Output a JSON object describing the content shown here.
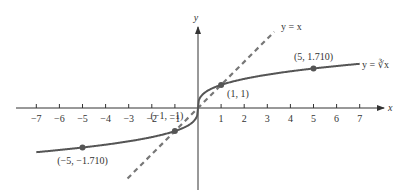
{
  "chart_data": {
    "type": "line",
    "title": "",
    "xlabel": "x",
    "ylabel": "y",
    "xlim": [
      -7.8,
      8
    ],
    "ylim": [
      -3.5,
      3.5
    ],
    "grid": false,
    "x_ticks": [
      -7,
      -6,
      -5,
      -4,
      -3,
      -2,
      -1,
      1,
      2,
      3,
      4,
      5,
      6,
      7
    ],
    "x_tick_labels": [
      "−7",
      "−6",
      "−5",
      "−4",
      "−3",
      "−2",
      "−1",
      "1",
      "2",
      "3",
      "4",
      "5",
      "6",
      "7"
    ],
    "series": [
      {
        "name": "y = ∛x",
        "style": "solid",
        "color": "#555555",
        "function": "cbrt",
        "x_range": [
          -7,
          7
        ],
        "sample_points": [
          {
            "x": -7,
            "y": -1.913
          },
          {
            "x": -5,
            "y": -1.71
          },
          {
            "x": -1,
            "y": -1
          },
          {
            "x": 0,
            "y": 0
          },
          {
            "x": 1,
            "y": 1
          },
          {
            "x": 5,
            "y": 1.71
          },
          {
            "x": 7,
            "y": 1.913
          }
        ]
      },
      {
        "name": "y = x",
        "style": "dashed",
        "color": "#777777",
        "function": "identity",
        "x_range": [
          -3.05,
          3.3
        ]
      }
    ],
    "annotations": [
      {
        "label": "(5, 1.710)",
        "x": 5,
        "y": 1.71
      },
      {
        "label": "(1, 1)",
        "x": 1,
        "y": 1
      },
      {
        "label": "(−1, −1)",
        "x": -1,
        "y": -1
      },
      {
        "label": "(−5, −1.710)",
        "x": -5,
        "y": -1.71
      }
    ],
    "curve_labels": {
      "cbrt": "y = ∛x",
      "identity": "y = x"
    }
  }
}
